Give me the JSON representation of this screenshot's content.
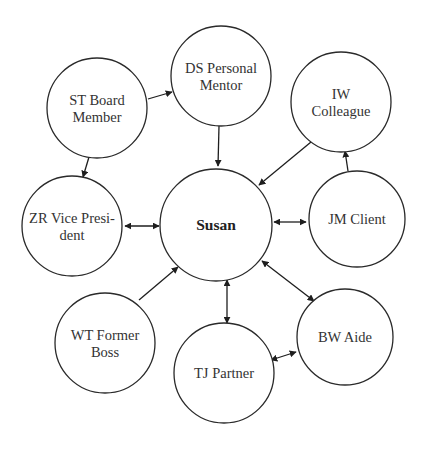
{
  "diagram": {
    "title": "",
    "type": "relationship-network",
    "colors": {
      "stroke": "#2a2a2a",
      "fill": "#ffffff",
      "text": "#333333",
      "background": "#ffffff"
    },
    "nodes": [
      {
        "id": "susan",
        "lines": [
          "Susan"
        ],
        "cx": 216,
        "cy": 225,
        "r": 56,
        "center": true
      },
      {
        "id": "st",
        "lines": [
          "ST Board",
          "Member"
        ],
        "cx": 97,
        "cy": 108,
        "r": 50
      },
      {
        "id": "ds",
        "lines": [
          "DS Personal",
          "Mentor"
        ],
        "cx": 221,
        "cy": 76,
        "r": 50
      },
      {
        "id": "iw",
        "lines": [
          "IW",
          "Colleague"
        ],
        "cx": 341,
        "cy": 102,
        "r": 50
      },
      {
        "id": "zr",
        "lines": [
          "ZR Vice Presi-",
          "dent"
        ],
        "cx": 72,
        "cy": 226,
        "r": 50
      },
      {
        "id": "jm",
        "lines": [
          "JM Client"
        ],
        "cx": 357,
        "cy": 219,
        "r": 48
      },
      {
        "id": "wt",
        "lines": [
          "WT Former",
          "Boss"
        ],
        "cx": 105,
        "cy": 343,
        "r": 50
      },
      {
        "id": "tj",
        "lines": [
          "TJ Partner"
        ],
        "cx": 224,
        "cy": 373,
        "r": 50
      },
      {
        "id": "bw",
        "lines": [
          "BW Aide"
        ],
        "cx": 345,
        "cy": 337,
        "r": 48
      }
    ],
    "edges": [
      {
        "from": "st",
        "to": "ds",
        "direction": "forward",
        "x1": 148,
        "y1": 99,
        "x2": 172,
        "y2": 92
      },
      {
        "from": "st",
        "to": "zr",
        "direction": "forward",
        "x1": 89,
        "y1": 157,
        "x2": 83,
        "y2": 177
      },
      {
        "from": "ds",
        "to": "susan",
        "direction": "forward",
        "x1": 219,
        "y1": 126,
        "x2": 218,
        "y2": 166
      },
      {
        "from": "iw",
        "to": "susan",
        "direction": "forward",
        "x1": 311,
        "y1": 142,
        "x2": 259,
        "y2": 185
      },
      {
        "from": "jm",
        "to": "iw",
        "direction": "forward",
        "x1": 348,
        "y1": 171,
        "x2": 345,
        "y2": 151
      },
      {
        "from": "zr",
        "to": "susan",
        "direction": "both",
        "x1": 125,
        "y1": 226,
        "x2": 159,
        "y2": 226
      },
      {
        "from": "susan",
        "to": "jm",
        "direction": "both",
        "x1": 274,
        "y1": 222,
        "x2": 306,
        "y2": 222
      },
      {
        "from": "wt",
        "to": "susan",
        "direction": "forward",
        "x1": 139,
        "y1": 300,
        "x2": 178,
        "y2": 267
      },
      {
        "from": "susan",
        "to": "tj",
        "direction": "both",
        "x1": 227,
        "y1": 280,
        "x2": 227,
        "y2": 323
      },
      {
        "from": "susan",
        "to": "bw",
        "direction": "both",
        "x1": 262,
        "y1": 261,
        "x2": 314,
        "y2": 301
      },
      {
        "from": "tj",
        "to": "bw",
        "direction": "both",
        "x1": 271,
        "y1": 360,
        "x2": 296,
        "y2": 352
      }
    ]
  }
}
